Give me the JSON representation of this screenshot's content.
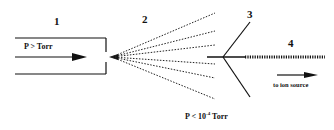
{
  "diagram": {
    "regions": [
      {
        "id": "1",
        "label": "1"
      },
      {
        "id": "2",
        "label": "2"
      },
      {
        "id": "3",
        "label": "3"
      },
      {
        "id": "4",
        "label": "4"
      }
    ],
    "inlet_pressure": "P > Torr",
    "vacuum_pressure": {
      "prefix": "P < 10",
      "exponent": "-4",
      "suffix": " Torr"
    },
    "exit_label": "to ion source",
    "colors": {
      "ink": "#111111",
      "background": "#ffffff"
    }
  }
}
